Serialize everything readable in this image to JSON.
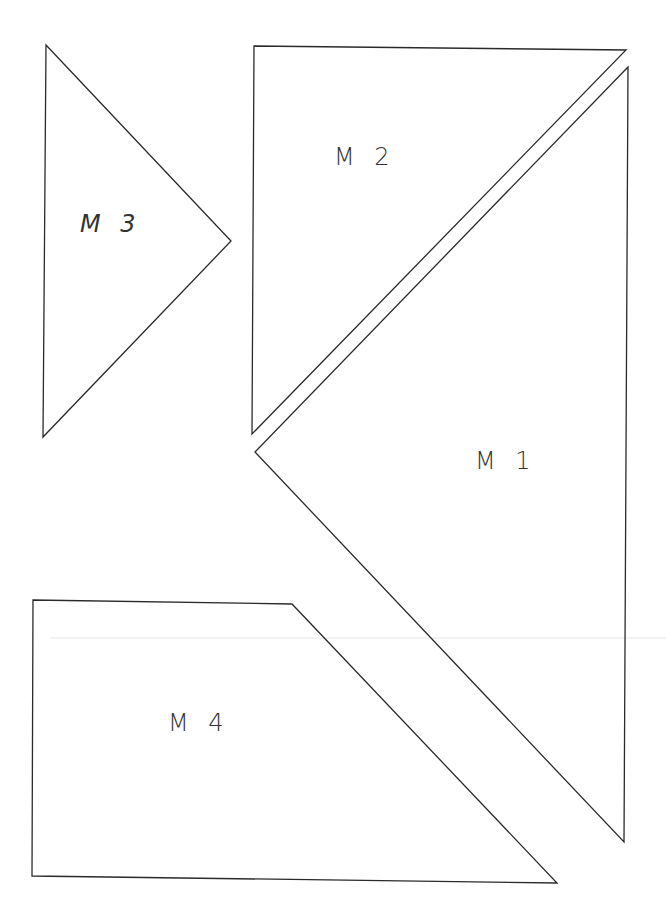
{
  "colors": {
    "stroke": "#2a2a2a",
    "background": "#ffffff",
    "scan_line": "#e6e6e6"
  },
  "pieces": [
    {
      "id": "M1",
      "label": "M 1",
      "points": "628,67 255,452 624,842",
      "label_pos": [
        475,
        447
      ]
    },
    {
      "id": "M2",
      "label": "M 2",
      "points": "254,46 626,50 252,434",
      "label_pos": [
        334,
        143
      ]
    },
    {
      "id": "M3",
      "label": "M 3",
      "points": "46,45 231,241 43,437",
      "label_pos": [
        80,
        210
      ]
    },
    {
      "id": "M4",
      "label": "M 4",
      "points": "33,600 292,604 557,883 32,876",
      "label_pos": [
        168,
        709
      ]
    }
  ]
}
